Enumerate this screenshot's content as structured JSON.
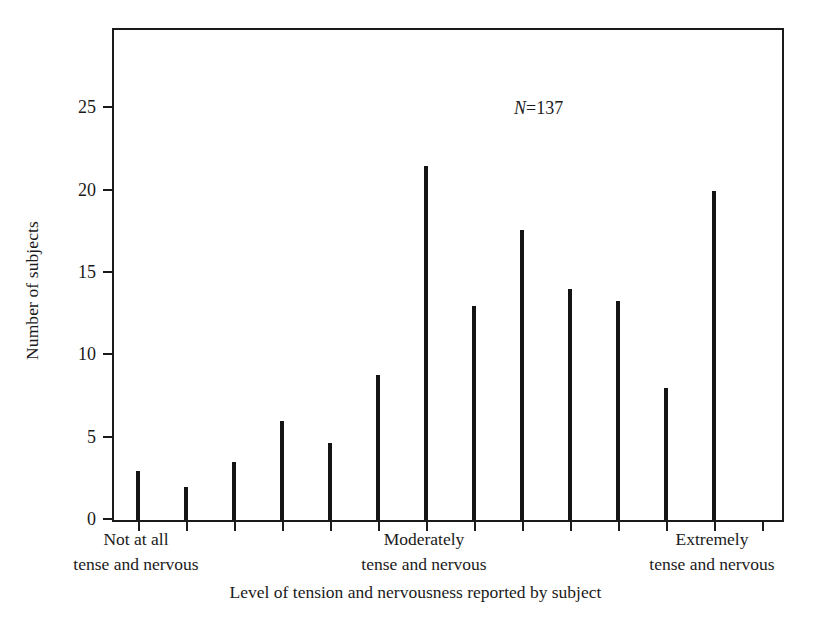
{
  "chart_data": {
    "type": "bar",
    "title": "",
    "xlabel": "Level of tension and nervousness reported by subject",
    "ylabel": "Number of subjects",
    "annotation": "N=137",
    "annotation_variable": "N",
    "annotation_value": "=137",
    "ylim": [
      0,
      30
    ],
    "yticks": [
      0,
      5,
      10,
      15,
      20,
      25
    ],
    "ytick_labels": [
      "0",
      "5",
      "10",
      "15",
      "20",
      "25"
    ],
    "grid": false,
    "legend": null,
    "categories": [
      "1",
      "2",
      "3",
      "4",
      "5",
      "6",
      "7",
      "8",
      "9",
      "10",
      "11",
      "12",
      "13"
    ],
    "values": [
      3,
      2,
      3.5,
      6,
      4.7,
      8.8,
      21.5,
      13,
      17.6,
      14,
      13.3,
      8,
      20
    ],
    "xtick_count": 14,
    "x_category_labels": [
      {
        "line1": "Not at all",
        "line2": "tense and nervous",
        "at_category": 1
      },
      {
        "line1": "Moderately",
        "line2": "tense and nervous",
        "at_category": 7
      },
      {
        "line1": "Extremely",
        "line2": "tense and nervous",
        "at_category": 13
      }
    ]
  }
}
